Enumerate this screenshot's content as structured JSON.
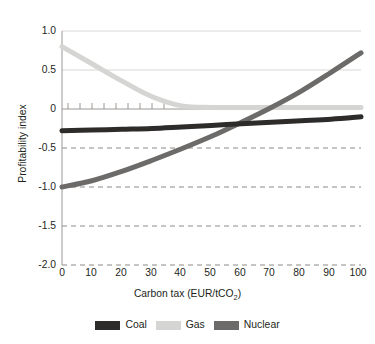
{
  "figure": {
    "title_partial": "",
    "background": "#ffffff"
  },
  "axes": {
    "y_label": "Profitability index",
    "x_label_main": "Carbon tax (EUR/tCO",
    "x_label_sub": "2",
    "x_label_close": ")",
    "y_ticks": [
      "1.0",
      "0.5",
      "0",
      "-0.5",
      "-1.0",
      "-1.5",
      "-2.0"
    ],
    "x_ticks": [
      "0",
      "10",
      "20",
      "30",
      "40",
      "50",
      "60",
      "70",
      "80",
      "90",
      "100"
    ]
  },
  "legend": {
    "items": [
      {
        "label": "Coal",
        "color": "#2e2c2b"
      },
      {
        "label": "Gas",
        "color": "#d5d5d3"
      },
      {
        "label": "Nuclear",
        "color": "#6d6b6a"
      }
    ]
  },
  "colors": {
    "coal": "#2e2c2b",
    "gas": "#d5d5d3",
    "nuclear": "#6d6b6a",
    "axis": "#9a9896",
    "gridline_solid": "#d9d7d5",
    "gridline_dashed": "#8c8a88",
    "text": "#231f20"
  },
  "chart_data": {
    "type": "line",
    "title": "",
    "xlabel": "Carbon tax (EUR/tCO2)",
    "ylabel": "Profitability index",
    "xlim": [
      0,
      100
    ],
    "ylim": [
      -2.0,
      1.0
    ],
    "xticks": [
      0,
      10,
      20,
      30,
      40,
      50,
      60,
      70,
      80,
      90,
      100
    ],
    "yticks": [
      1.0,
      0.5,
      0,
      -0.5,
      -1.0,
      -1.5,
      -2.0
    ],
    "grid": "horizontal",
    "legend_position": "bottom-center",
    "x": [
      0,
      10,
      20,
      30,
      40,
      50,
      60,
      70,
      80,
      90,
      100
    ],
    "series": [
      {
        "name": "Coal",
        "color": "#2e2c2b",
        "values": [
          -0.28,
          -0.27,
          -0.26,
          -0.25,
          -0.23,
          -0.21,
          -0.19,
          -0.17,
          -0.15,
          -0.13,
          -0.1
        ]
      },
      {
        "name": "Gas",
        "color": "#d5d5d3",
        "values": [
          0.8,
          0.58,
          0.36,
          0.16,
          0.04,
          0.02,
          0.02,
          0.02,
          0.02,
          0.02,
          0.02
        ]
      },
      {
        "name": "Nuclear",
        "color": "#6d6b6a",
        "values": [
          -1.0,
          -0.92,
          -0.8,
          -0.66,
          -0.51,
          -0.35,
          -0.17,
          0.02,
          0.23,
          0.47,
          0.72
        ]
      }
    ],
    "annotations": {
      "zero_line_ticks": "small upward ticks along y=0 from x=2 to x=40",
      "nuclear_zero_crossing": 62
    }
  }
}
